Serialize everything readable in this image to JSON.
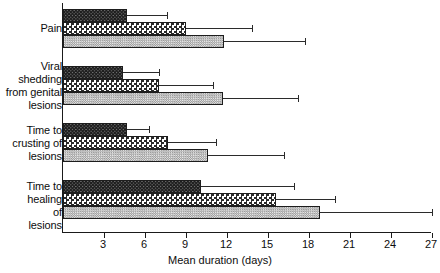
{
  "chart_data": {
    "type": "bar",
    "orientation": "horizontal",
    "title": "",
    "xlabel": "Mean duration (days)",
    "ylabel": "",
    "xlim": [
      0,
      27
    ],
    "xticks": [
      3,
      6,
      9,
      12,
      15,
      18,
      21,
      24,
      27
    ],
    "xtick_labels": [
      "3",
      "6",
      "9",
      "12",
      "15",
      "18",
      "21",
      "24",
      "27"
    ],
    "grid": false,
    "legend": "none",
    "categories": [
      "Pain",
      "Viral shedding from genital lesions",
      "Time to crusting of lesions",
      "Time to healing of lesions"
    ],
    "category_label_lines": [
      [
        "Pain"
      ],
      [
        "Viral",
        "shedding",
        "from genital",
        "lesions"
      ],
      [
        "Time to",
        "crusting of",
        "lesions"
      ],
      [
        "Time to",
        "healing",
        "of",
        "lesions"
      ]
    ],
    "series": [
      {
        "name": "series-1",
        "pattern": "dark-crosshatch",
        "values": [
          4.7,
          4.4,
          4.7,
          10.1
        ],
        "errors_upper": [
          7.6,
          7.0,
          6.3,
          16.9
        ]
      },
      {
        "name": "series-2",
        "pattern": "checkerboard",
        "values": [
          9.0,
          7.0,
          7.7,
          15.6
        ],
        "errors_upper": [
          13.8,
          11.0,
          11.2,
          19.9
        ]
      },
      {
        "name": "series-3",
        "pattern": "light-stipple",
        "values": [
          11.8,
          11.7,
          10.6,
          18.8
        ],
        "errors_upper": [
          17.7,
          17.2,
          16.2,
          27.0
        ]
      }
    ],
    "colors": {
      "axis": "#1a1a1a",
      "text": "#0d0d0d",
      "dark_bar": "#1c1c1c",
      "check_bar": "#2a2a2a",
      "light_bar": "#d8d8d8",
      "error_bar": "#2b2b2b"
    }
  }
}
